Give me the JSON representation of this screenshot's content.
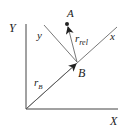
{
  "diagram": {
    "colors": {
      "line": "#555555",
      "axis": "#444444",
      "text": "#222222",
      "background": "#ffffff"
    },
    "labels": {
      "Y_axis": "Y",
      "X_axis": "X",
      "x_axis_rotated": "x",
      "y_axis_rotated": "y",
      "point_A": "A",
      "point_B": "B",
      "r_rel_main": "r",
      "r_rel_sub": "rel",
      "r_B_main": "r",
      "r_B_sub": "B"
    }
  }
}
